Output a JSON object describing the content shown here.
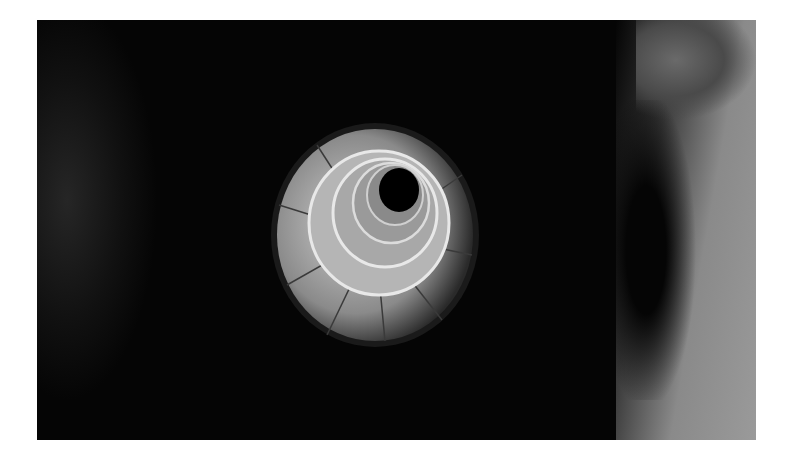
{
  "image": {
    "subject": "spiral-staircase-from-above",
    "style": "black-and-white photograph",
    "colors": {
      "background": "#ffffff",
      "dark": "#050505",
      "stone": "#9a9a9a",
      "wall": "#8a8a8a"
    }
  }
}
